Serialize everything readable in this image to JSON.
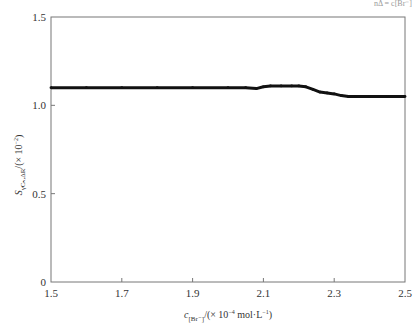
{
  "chart_data": {
    "type": "line",
    "title": "",
    "corner_fragment": "nΔ = c[Br⁻]",
    "xlabel": {
      "main": "c",
      "sub": "[Br⁻]",
      "rest": "/(× 10",
      "sup": "−4",
      "rest2": " mol·L",
      "sup2": "−1",
      "end": ")"
    },
    "ylabel": {
      "main": "S",
      "sub": "γCₙ,ΔR",
      "rest": "/(× 10",
      "sup": "−2",
      "end": ")"
    },
    "xlim": [
      1.5,
      2.5
    ],
    "ylim": [
      0,
      1.5
    ],
    "xticks": [
      "1.5",
      "1.7",
      "1.9",
      "2.1",
      "2.3",
      "2.5"
    ],
    "yticks": [
      "0",
      "0.5",
      "1.0",
      "1.5"
    ],
    "grid": false,
    "series": [
      {
        "name": "S",
        "color": "#111111",
        "x": [
          1.5,
          1.6,
          1.7,
          1.8,
          1.9,
          2.0,
          2.05,
          2.08,
          2.1,
          2.12,
          2.15,
          2.18,
          2.2,
          2.22,
          2.24,
          2.26,
          2.28,
          2.3,
          2.32,
          2.34,
          2.36,
          2.4,
          2.45,
          2.5
        ],
        "y": [
          1.1,
          1.1,
          1.1,
          1.1,
          1.1,
          1.1,
          1.1,
          1.095,
          1.105,
          1.11,
          1.11,
          1.11,
          1.11,
          1.105,
          1.09,
          1.075,
          1.07,
          1.065,
          1.055,
          1.05,
          1.05,
          1.05,
          1.05,
          1.05
        ]
      }
    ]
  }
}
